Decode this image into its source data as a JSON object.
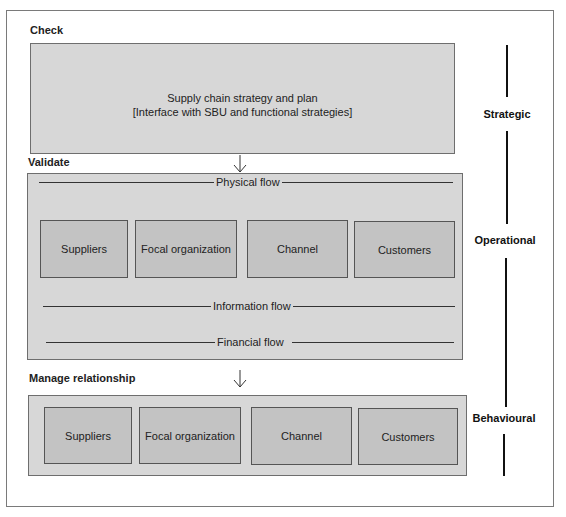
{
  "sections": {
    "check": {
      "label": "Check",
      "box_line1": "Supply chain strategy and plan",
      "box_line2": "[Interface with SBU and functional strategies]"
    },
    "validate": {
      "label": "Validate",
      "flows": {
        "physical": "Physical flow",
        "information": "Information flow",
        "financial": "Financial flow"
      },
      "entities": [
        "Suppliers",
        "Focal organization",
        "Channel",
        "Customers"
      ]
    },
    "manage_relationship": {
      "label": "Manage relationship",
      "entities": [
        "Suppliers",
        "Focal organization",
        "Channel",
        "Customers"
      ]
    }
  },
  "levels": {
    "strategic": "Strategic",
    "operational": "Operational",
    "behavioural": "Behavioural"
  },
  "colors": {
    "outer_box_fill": "#d7d7d7",
    "entity_fill": "#c3c3c3",
    "line": "#111111"
  }
}
